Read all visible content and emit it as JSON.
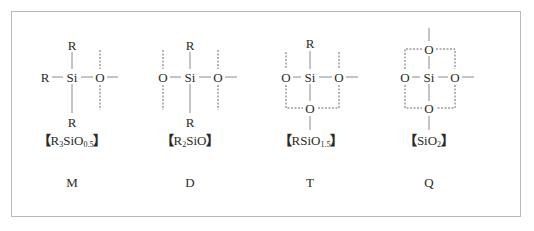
{
  "figure": {
    "units": [
      {
        "id": "M",
        "letter": "M",
        "formula": {
          "open": "【",
          "parts": [
            [
              "R",
              ""
            ],
            [
              "3",
              "sub"
            ],
            [
              "SiO",
              ""
            ],
            [
              "0.5",
              "sub"
            ]
          ],
          "close": "】"
        },
        "atoms": {
          "center": "Si",
          "top": "R",
          "left": "R",
          "right": "O",
          "bottom": "R"
        }
      },
      {
        "id": "D",
        "letter": "D",
        "formula": {
          "open": "【",
          "parts": [
            [
              "R",
              ""
            ],
            [
              "2",
              "sub"
            ],
            [
              "SiO",
              ""
            ]
          ],
          "close": "】"
        },
        "atoms": {
          "center": "Si",
          "top": "R",
          "left": "O",
          "right": "O",
          "bottom": "R"
        }
      },
      {
        "id": "T",
        "letter": "T",
        "formula": {
          "open": "【",
          "parts": [
            [
              "RSiO",
              ""
            ],
            [
              "1.5",
              "sub"
            ]
          ],
          "close": "】"
        },
        "atoms": {
          "center": "Si",
          "top": "R",
          "left": "O",
          "right": "O",
          "bottom": "O"
        }
      },
      {
        "id": "Q",
        "letter": "Q",
        "formula": {
          "open": "【",
          "parts": [
            [
              "SiO",
              ""
            ],
            [
              "2",
              "sub"
            ]
          ],
          "close": "】"
        },
        "atoms": {
          "center": "Si",
          "top": "O",
          "left": "O",
          "right": "O",
          "bottom": "O"
        }
      }
    ]
  }
}
